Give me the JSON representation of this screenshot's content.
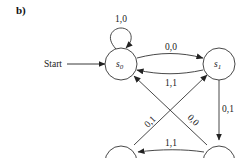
{
  "figure_label": "b)",
  "start_label": "Start",
  "states": [
    {
      "id": "s0",
      "name": "s",
      "sub": "0"
    },
    {
      "id": "s1",
      "name": "s",
      "sub": "1"
    },
    {
      "id": "s3",
      "name": "",
      "sub": ""
    },
    {
      "id": "s2",
      "name": "",
      "sub": ""
    }
  ],
  "transitions": [
    {
      "from": "s0",
      "to": "s0",
      "label": "1,0"
    },
    {
      "from": "s0",
      "to": "s1",
      "label": "0,0"
    },
    {
      "from": "s1",
      "to": "s0",
      "label": "1,1"
    },
    {
      "from": "s1",
      "to": "s2",
      "label": "0,1"
    },
    {
      "from": "s3",
      "to": "s1",
      "label": "0,1"
    },
    {
      "from": "s2",
      "to": "s0",
      "label": "0,0"
    },
    {
      "from": "s2",
      "to": "s3",
      "label": "1,1"
    }
  ]
}
